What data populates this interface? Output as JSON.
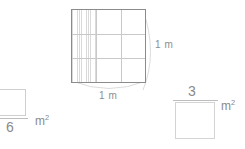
{
  "diagram": {
    "main_square": {
      "name": "unit-square",
      "rows": 3,
      "cols": 3,
      "total_cells": 9,
      "shaded_cells": 3,
      "shaded_region": "left column",
      "side_label_right": "1 m",
      "side_label_bottom": "1 m",
      "border_color": "#8b8b8b",
      "grid_color": "#c9c9c9",
      "shade_color": "#d8d8d8"
    },
    "answers": {
      "left": {
        "name": "fraction-answer-left",
        "numerator": "",
        "denominator": "6",
        "unit_base": "m",
        "unit_exponent": "2",
        "unit_display": "m²"
      },
      "right": {
        "name": "fraction-answer-right",
        "numerator": "3",
        "denominator": "",
        "unit_base": "m",
        "unit_exponent": "2",
        "unit_display": "m²"
      }
    },
    "colors": {
      "background": "#ffffff",
      "text": "#8a8a8a",
      "rule": "#bdbdbd",
      "answer_box_border": "#d4d4d4",
      "arc": "#dcdcdc"
    }
  }
}
